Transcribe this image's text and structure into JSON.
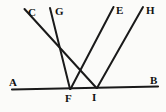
{
  "figure": {
    "background_color": "#fbfbf9",
    "ink_color": "#1a1a1a",
    "baseline": {
      "name": "line-AB",
      "from_label": "A",
      "to_label": "B",
      "x1": 12,
      "y1": 89.5,
      "x2": 158,
      "y2": 86.5,
      "stroke_width": 2.1
    },
    "rays": [
      {
        "name": "line-CI",
        "top_label": "C",
        "foot_label": "I",
        "x1": 24.5,
        "y1": 9.0,
        "x2": 96.5,
        "y2": 88.0,
        "stroke_width": 2.0
      },
      {
        "name": "line-GF",
        "top_label": "G",
        "foot_label": "F",
        "x1": 50.0,
        "y1": 8.0,
        "x2": 70.0,
        "y2": 89.0,
        "stroke_width": 2.0
      },
      {
        "name": "line-EF",
        "top_label": "E",
        "foot_label": "F",
        "x1": 113.5,
        "y1": 7.0,
        "x2": 70.5,
        "y2": 89.0,
        "stroke_width": 2.0
      },
      {
        "name": "line-HI",
        "top_label": "H",
        "foot_label": "I",
        "x1": 143.0,
        "y1": 7.0,
        "x2": 97.0,
        "y2": 88.0,
        "stroke_width": 2.0
      }
    ],
    "crossing_point": {
      "name": "crossing-CI-EF",
      "x": 82,
      "y": 62
    },
    "labels": {
      "C": "C",
      "G": "G",
      "E": "E",
      "H": "H",
      "A": "A",
      "B": "B",
      "F": "F",
      "I": "I"
    },
    "label_positions": {
      "C": {
        "x": 28,
        "y": 7
      },
      "G": {
        "x": 55,
        "y": 6
      },
      "E": {
        "x": 116,
        "y": 5
      },
      "H": {
        "x": 146,
        "y": 5
      },
      "A": {
        "x": 9,
        "y": 77
      },
      "B": {
        "x": 150,
        "y": 75
      },
      "F": {
        "x": 65,
        "y": 93
      },
      "I": {
        "x": 92,
        "y": 92
      }
    }
  }
}
